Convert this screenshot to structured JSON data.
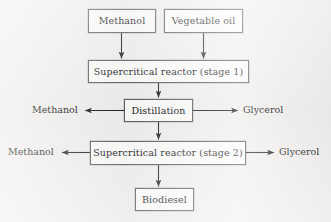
{
  "diagram": {
    "type": "process-flow-diagram",
    "background_color": "#f1f0ee",
    "box_fill_color": "#fcfcfb",
    "box_border_color": "#5c5c5c",
    "arrow_color": "#1f1f1f",
    "nodes": [
      {
        "id": "methanol_feed",
        "label": "Methanol",
        "x": 88,
        "y": 9,
        "w": 68,
        "h": 24
      },
      {
        "id": "vegetable_oil",
        "label": "Vegetable oil",
        "x": 164,
        "y": 9,
        "w": 79,
        "h": 24
      },
      {
        "id": "reactor_stage1",
        "label": "Supercritical reactor (stage 1)",
        "x": 88,
        "y": 60,
        "w": 161,
        "h": 23
      },
      {
        "id": "distillation",
        "label": "Distillation",
        "x": 124,
        "y": 99,
        "w": 69,
        "h": 23
      },
      {
        "id": "reactor_stage2",
        "label": "Supercritical reactor (stage 2)",
        "x": 90,
        "y": 141,
        "w": 156,
        "h": 24
      },
      {
        "id": "biodiesel",
        "label": "Biodiesel",
        "x": 135,
        "y": 188,
        "w": 59,
        "h": 23
      }
    ],
    "side_labels": [
      {
        "id": "distillation_methanol_out",
        "label": "Methanol",
        "x": 32,
        "y": 105
      },
      {
        "id": "distillation_glycerol_out",
        "label": "Glycerol",
        "x": 243,
        "y": 105
      },
      {
        "id": "stage2_methanol_out",
        "label": "Methanol",
        "x": 8,
        "y": 147
      },
      {
        "id": "stage2_glycerol_out",
        "label": "Glycerol",
        "x": 279,
        "y": 147
      }
    ],
    "edges": [
      {
        "id": "methanol-to-stage1",
        "from": "methanol_feed",
        "to": "reactor_stage1",
        "direction": "down"
      },
      {
        "id": "oil-to-stage1",
        "from": "vegetable_oil",
        "to": "reactor_stage1",
        "direction": "down"
      },
      {
        "id": "stage1-to-distillation",
        "from": "reactor_stage1",
        "to": "distillation",
        "direction": "down"
      },
      {
        "id": "distillation-methanol",
        "from": "distillation",
        "to": "distillation_methanol_out",
        "direction": "left"
      },
      {
        "id": "distillation-glycerol",
        "from": "distillation",
        "to": "distillation_glycerol_out",
        "direction": "right"
      },
      {
        "id": "distillation-to-stage2",
        "from": "distillation",
        "to": "reactor_stage2",
        "direction": "down"
      },
      {
        "id": "stage2-methanol",
        "from": "reactor_stage2",
        "to": "stage2_methanol_out",
        "direction": "left"
      },
      {
        "id": "stage2-glycerol",
        "from": "reactor_stage2",
        "to": "stage2_glycerol_out",
        "direction": "right"
      },
      {
        "id": "stage2-to-biodiesel",
        "from": "reactor_stage2",
        "to": "biodiesel",
        "direction": "down"
      }
    ]
  }
}
